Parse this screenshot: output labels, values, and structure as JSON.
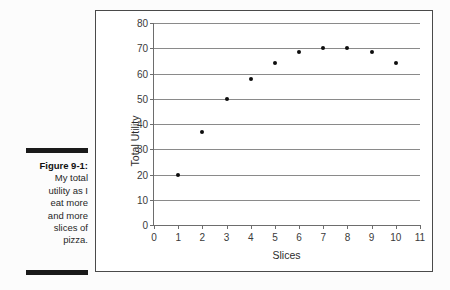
{
  "figure": {
    "label": "Figure 9-1:",
    "caption_lines": [
      "My total",
      "utility as I",
      "eat more",
      "and more",
      "slices of",
      "pizza."
    ]
  },
  "colors": {
    "frame": "#4a4a4a",
    "gridline": "#8a8a8a",
    "axis": "#6d6d6d",
    "marker": "#0d0d0d",
    "page_background": "#fcfcfc",
    "plot_background": "#ffffff",
    "rule": "#1a1a1a"
  },
  "chart_data": {
    "type": "scatter",
    "title": "",
    "xlabel": "Slices",
    "ylabel": "Total Utility",
    "xlim": [
      0,
      11
    ],
    "ylim": [
      0,
      80
    ],
    "xticks": [
      0,
      1,
      2,
      3,
      4,
      5,
      6,
      7,
      8,
      9,
      10,
      11
    ],
    "yticks": [
      0,
      10,
      20,
      30,
      40,
      50,
      60,
      70,
      80
    ],
    "xtick_labels": [
      "0",
      "1",
      "2",
      "3",
      "4",
      "5",
      "6",
      "7",
      "8",
      "9",
      "10",
      "11"
    ],
    "ytick_labels": [
      "0",
      "10",
      "20",
      "30",
      "40",
      "50",
      "60",
      "70",
      "80"
    ],
    "grid": "horizontal",
    "legend": "none",
    "series": [
      {
        "name": "Total Utility",
        "x": [
          1,
          2,
          3,
          4,
          5,
          6,
          7,
          8,
          9,
          10
        ],
        "y": [
          20,
          37,
          50,
          58,
          64,
          68.5,
          70,
          70,
          68.5,
          64
        ]
      }
    ]
  }
}
